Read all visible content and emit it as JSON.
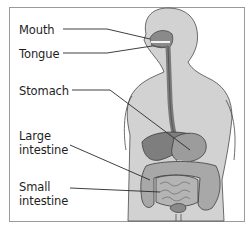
{
  "diagram": {
    "labels": [
      {
        "id": "mouth",
        "text": "Mouth",
        "lines": [
          "Mouth"
        ]
      },
      {
        "id": "tongue",
        "text": "Tongue",
        "lines": [
          "Tongue"
        ]
      },
      {
        "id": "stomach",
        "text": "Stomach",
        "lines": [
          "Stomach"
        ]
      },
      {
        "id": "large-intestine",
        "text": "Large intestine",
        "lines": [
          "Large",
          "intestine"
        ]
      },
      {
        "id": "small-intestine",
        "text": "Small intestine",
        "lines": [
          "Small",
          "intestine"
        ]
      }
    ],
    "colors": {
      "body": "#d2d2d2",
      "organ_dark": "#7a7a7a",
      "organ_mid": "#9c9c9c",
      "outline": "#3c3c3c",
      "frame": "#9a9a9a"
    }
  }
}
